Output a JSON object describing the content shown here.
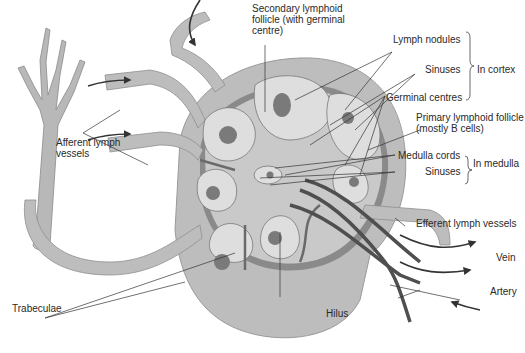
{
  "colors": {
    "background": "#ffffff",
    "capsule": "#a9a9a9",
    "sinus": "#c4c4c4",
    "follicle": "#dcdcdc",
    "germinal_centre": "#7a7a7a",
    "trabecula": "#6e6e6e",
    "vessel": "#5a5a5a",
    "text": "#2a2a2a",
    "leader_line": "#333333"
  },
  "labels": {
    "secondary_follicle": "Secondary lymphoid follicle (with germinal centre)",
    "lymph_nodules": "Lymph nodules",
    "sinuses_cortex": "Sinuses",
    "germinal_centres": "Germinal centres",
    "in_cortex": "In cortex",
    "primary_follicle": "Primary lymphoid follicle (mostly B cells)",
    "medulla_cords": "Medulla cords",
    "sinuses_medulla": "Sinuses",
    "in_medulla": "In medulla",
    "afferent": "Afferent lymph vessels",
    "efferent": "Efferent lymph vessels",
    "vein": "Vein",
    "artery": "Artery",
    "hilus": "Hilus",
    "trabeculae": "Trabeculae"
  }
}
